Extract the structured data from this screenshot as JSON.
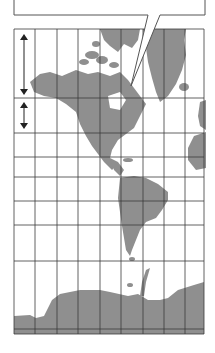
{
  "figure": {
    "type": "mercator-map-distortion-diagram",
    "projection_hint": "Mercator",
    "callout": {
      "text": "",
      "note": "callout text cut off at top edge of image"
    },
    "colors": {
      "land": "#8f8f8f",
      "grid": "#3a3a3a",
      "background": "#ffffff",
      "outline": "#555555",
      "arrow": "#222222"
    },
    "grid": {
      "vertical_lines_x": [
        14,
        35,
        57,
        78,
        100,
        121,
        143,
        164,
        185,
        204
      ],
      "horizontal_lines_y": [
        29,
        98,
        133,
        157,
        177,
        201,
        225,
        261,
        329,
        334
      ]
    },
    "arrows": [
      {
        "name": "high-latitude-span-arrow",
        "x": 24,
        "y1": 35,
        "y2": 94,
        "style": "double-headed"
      },
      {
        "name": "mid-latitude-span-arrow",
        "x": 24,
        "y1": 103,
        "y2": 128,
        "style": "double-headed"
      }
    ],
    "regions": [
      "North America",
      "Greenland",
      "Canadian Arctic Archipelago",
      "South America",
      "Antarctica",
      "Western Europe",
      "West Africa"
    ]
  }
}
